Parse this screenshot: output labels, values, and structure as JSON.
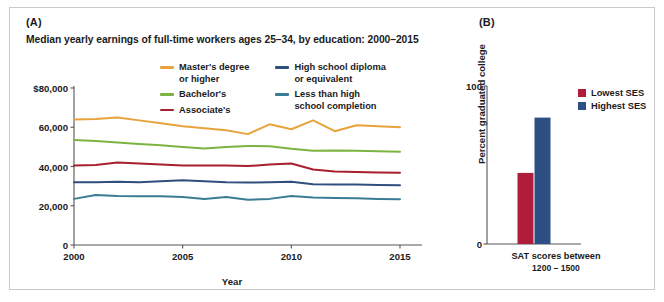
{
  "figure": {
    "panel_a_letter": "(A)",
    "panel_b_letter": "(B)"
  },
  "colors": {
    "masters": "#e8a33d",
    "bachelors": "#7cb342",
    "associates": "#a81f2e",
    "highschool": "#2f4f7f",
    "lessthanhs": "#3a7c94",
    "lowest_ses": "#b01d3a",
    "highest_ses": "#2d4f84",
    "axis": "#555555",
    "text": "#1b1b1b",
    "frame": "#c9c9c9"
  },
  "chart_data": [
    {
      "type": "line",
      "panel": "A",
      "title": "Median yearly earnings of full-time workers ages 25–34, by education: 2000–2015",
      "xlabel": "Year",
      "ylabel": "",
      "xlim": [
        2000,
        2015
      ],
      "ylim": [
        0,
        80000
      ],
      "grid": false,
      "legend_position": "top-center",
      "x": [
        2000,
        2001,
        2002,
        2003,
        2004,
        2005,
        2006,
        2007,
        2008,
        2009,
        2010,
        2011,
        2012,
        2013,
        2014,
        2015
      ],
      "xticks": [
        2000,
        2005,
        2010,
        2015
      ],
      "xticklabels": [
        "2000",
        "2005",
        "2010",
        "2015"
      ],
      "yticks": [
        0,
        20000,
        40000,
        60000,
        80000
      ],
      "yticklabels": [
        "0",
        "20,000",
        "40,000",
        "60,000",
        "$80,000"
      ],
      "series": [
        {
          "name": "Master's degree or higher",
          "color": "#e8a33d",
          "values": [
            64000,
            64200,
            65000,
            63500,
            62000,
            60500,
            59500,
            58500,
            56500,
            61500,
            59000,
            63500,
            58000,
            61000,
            60500,
            60000
          ]
        },
        {
          "name": "Bachelor's",
          "color": "#7cb342",
          "values": [
            53500,
            53000,
            52200,
            51500,
            50800,
            50000,
            49200,
            50000,
            50500,
            50300,
            49000,
            48000,
            48200,
            48000,
            47800,
            47500
          ]
        },
        {
          "name": "Associate's",
          "color": "#a81f2e",
          "values": [
            40500,
            40800,
            42000,
            41500,
            41000,
            40500,
            40500,
            40500,
            40200,
            41000,
            41500,
            38500,
            37500,
            37200,
            37000,
            36800
          ]
        },
        {
          "name": "High school diploma or equivalent",
          "color": "#2f4f7f",
          "values": [
            32000,
            32000,
            32200,
            32000,
            32500,
            33000,
            32500,
            32000,
            31800,
            32000,
            32200,
            31000,
            30800,
            30800,
            30600,
            30500
          ]
        },
        {
          "name": "Less than high school completion",
          "color": "#3a7c94",
          "values": [
            23500,
            25500,
            25000,
            24800,
            24800,
            24500,
            23500,
            24500,
            23000,
            23500,
            25000,
            24200,
            24000,
            23800,
            23500,
            23300
          ]
        }
      ],
      "legend": [
        {
          "label": "Master's degree\nor higher",
          "color": "#e8a33d"
        },
        {
          "label": "Bachelor's",
          "color": "#7cb342"
        },
        {
          "label": "Associate's",
          "color": "#a81f2e"
        },
        {
          "label": "High school diploma\nor equivalent",
          "color": "#2f4f7f"
        },
        {
          "label": "Less than high\nschool completion",
          "color": "#3a7c94"
        }
      ]
    },
    {
      "type": "bar",
      "panel": "B",
      "title": "",
      "xlabel_line1": "SAT scores between",
      "xlabel_line2": "1200 – 1500",
      "ylabel": "Percent graduated college",
      "ylim": [
        0,
        100
      ],
      "yticks": [
        0,
        100
      ],
      "yticklabels": [
        "0",
        "100"
      ],
      "grid": false,
      "legend_position": "top-right",
      "categories": [
        "SAT scores between 1200 – 1500"
      ],
      "series": [
        {
          "name": "Lowest SES",
          "color": "#b01d3a",
          "values": [
            45
          ]
        },
        {
          "name": "Highest SES",
          "color": "#2d4f84",
          "values": [
            80
          ]
        }
      ]
    }
  ]
}
